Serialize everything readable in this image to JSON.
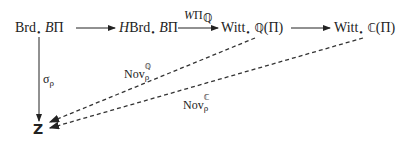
{
  "diagram": {
    "type": "commutative-diagram",
    "nodes": {
      "brd": {
        "main": "Brd",
        "dot": "•",
        "rest_italic": "B",
        "rest": "Π"
      },
      "hbrd": {
        "prefix_italic": "H",
        "main": "Brd",
        "dot": "•",
        "rest_italic": "B",
        "rest": "Π"
      },
      "witt_q": {
        "main": "Witt",
        "dot": "•",
        "field": "ℚ",
        "rest": "(Π)"
      },
      "witt_c": {
        "main": "Witt",
        "dot": "•",
        "field": "ℂ",
        "rest": "(Π)"
      },
      "z": {
        "label": "Z"
      }
    },
    "arrows": [
      {
        "from": "brd",
        "to": "hbrd",
        "style": "solid",
        "label": ""
      },
      {
        "from": "hbrd",
        "to": "witt_q",
        "style": "solid",
        "label": "WΠ_ℚ"
      },
      {
        "from": "witt_q",
        "to": "witt_c",
        "style": "solid",
        "label": ""
      },
      {
        "from": "brd",
        "to": "z",
        "style": "solid",
        "label": "σ_ρ"
      },
      {
        "from": "witt_q",
        "to": "z",
        "style": "dashed",
        "label": "Nov_ρ^ℚ"
      },
      {
        "from": "witt_c",
        "to": "z",
        "style": "dashed",
        "label": "Nov_ρ^ℂ"
      }
    ],
    "labels": {
      "w_pi_q": {
        "main_italic": "W",
        "main": "Π",
        "sub": "ℚ"
      },
      "sigma_rho": {
        "main": "σ",
        "sub": "ρ"
      },
      "nov_q": {
        "main": "Nov",
        "sup": "ℚ",
        "sub": "ρ"
      },
      "nov_c": {
        "main": "Nov",
        "sup": "ℂ",
        "sub": "ρ"
      }
    },
    "colors": {
      "ink": "#222222",
      "background": "#ffffff"
    }
  }
}
